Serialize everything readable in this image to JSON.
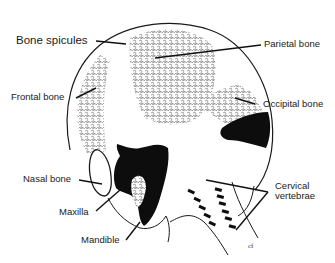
{
  "diagram": {
    "labels": [
      {
        "id": "bone-spicules",
        "text": "Bone spicules"
      },
      {
        "id": "parietal-bone",
        "text": "Parietal bone"
      },
      {
        "id": "frontal-bone",
        "text": "Frontal bone"
      },
      {
        "id": "occipital-bone",
        "text": "Occipital bone"
      },
      {
        "id": "nasal-bone",
        "text": "Nasal bone"
      },
      {
        "id": "maxilla",
        "text": "Maxilla"
      },
      {
        "id": "mandible",
        "text": "Mandible"
      },
      {
        "id": "cervical-vertebrae",
        "text": "Cervical\nvertebrae"
      }
    ],
    "signature": "cf",
    "colors": {
      "outline": "#1a1a1a",
      "spicule": "#8a8a8a",
      "solid": "#0d0d0d",
      "background": "#ffffff"
    }
  }
}
